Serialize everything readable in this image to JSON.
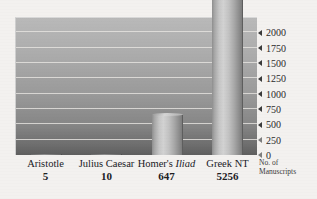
{
  "chart_data": {
    "type": "bar",
    "title": "",
    "subtitle": "",
    "xlabel": "",
    "ylabel": "No. of Manuscripts",
    "ylabel_lines": [
      "No. of",
      "Manuscripts"
    ],
    "categories": [
      "Aristotle",
      "Julius Caesar",
      "Homer's Iliad",
      "Greek NT"
    ],
    "category_labels": [
      {
        "prefix": "Aristotle",
        "italic": "",
        "suffix": ""
      },
      {
        "prefix": "Julius Caesar",
        "italic": "",
        "suffix": ""
      },
      {
        "prefix": "Homer's ",
        "italic": "Iliad",
        "suffix": ""
      },
      {
        "prefix": "Greek NT",
        "italic": "",
        "suffix": ""
      }
    ],
    "values": [
      5,
      10,
      647,
      5256
    ],
    "value_labels": [
      "5",
      "10",
      "647",
      "5256"
    ],
    "ylim": [
      0,
      2250
    ],
    "yticks": [
      0,
      250,
      500,
      750,
      1000,
      1250,
      1500,
      1750,
      2000
    ],
    "ytick_labels": [
      "0",
      "250",
      "500",
      "750",
      "1000",
      "1250",
      "1500",
      "1750",
      "2000"
    ],
    "grid": true,
    "grid_orientation": "horizontal",
    "legend": false,
    "legend_position": "none",
    "colors": {
      "bar_light": "#d2d2d2",
      "bar_dark": "#7c7c7c",
      "plot_bg_top": "#b9b9b9",
      "plot_bg_bottom": "#5f5f5f",
      "gridline": "#e4e2de",
      "page_bg": "#f3f1ef",
      "text": "#20201f"
    }
  }
}
